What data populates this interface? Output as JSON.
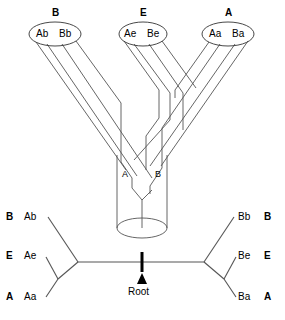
{
  "figure": {
    "title": "",
    "colors": {
      "stroke": "#555555",
      "heavy": "#000000",
      "background": "#ffffff"
    }
  },
  "top_panel": {
    "populations": [
      {
        "id": "B",
        "label": "B",
        "label_x": 55,
        "label_y": 8,
        "ellipse": {
          "cx": 55,
          "cy": 34,
          "rx": 26,
          "ry": 12
        },
        "alleles": [
          {
            "text": "Ab",
            "x": 43,
            "y": 34
          },
          {
            "text": "Bb",
            "x": 67,
            "y": 34
          }
        ]
      },
      {
        "id": "E",
        "label": "E",
        "label_x": 143,
        "label_y": 8,
        "ellipse": {
          "cx": 143,
          "cy": 34,
          "rx": 24,
          "ry": 12
        },
        "alleles": [
          {
            "text": "Ae",
            "x": 132,
            "y": 34
          },
          {
            "text": "Be",
            "x": 154,
            "y": 34
          }
        ]
      },
      {
        "id": "A",
        "label": "A",
        "label_x": 228,
        "label_y": 8,
        "ellipse": {
          "cx": 228,
          "cy": 34,
          "rx": 26,
          "ry": 12
        },
        "alleles": [
          {
            "text": "Aa",
            "x": 216,
            "y": 34
          },
          {
            "text": "Ba",
            "x": 240,
            "y": 34
          }
        ]
      }
    ],
    "tube_lineages": [
      {
        "text": "A",
        "x": 125,
        "y": 175
      },
      {
        "text": "B",
        "x": 158,
        "y": 175
      }
    ],
    "tube": {
      "left_x": 117,
      "right_x": 167,
      "top_y": 155,
      "bottom_y": 228,
      "base_ellipse_ry": 10
    }
  },
  "bottom_panel": {
    "left_tips": [
      {
        "pop": "B",
        "allele": "Ab",
        "pop_x": 8,
        "allele_x": 26,
        "y": 217
      },
      {
        "pop": "E",
        "allele": "Ae",
        "pop_x": 8,
        "allele_x": 26,
        "y": 256
      },
      {
        "pop": "A",
        "allele": "Aa",
        "pop_x": 8,
        "allele_x": 26,
        "y": 297
      }
    ],
    "right_tips": [
      {
        "pop": "B",
        "allele": "Bb",
        "allele_x": 240,
        "pop_x": 266,
        "y": 217
      },
      {
        "pop": "E",
        "allele": "Be",
        "allele_x": 240,
        "pop_x": 266,
        "y": 256
      },
      {
        "pop": "A",
        "allele": "Ba",
        "allele_x": 240,
        "pop_x": 266,
        "y": 297
      }
    ],
    "root": {
      "label": "Root",
      "label_x": 142,
      "label_y": 291,
      "tick_x": 142,
      "tick_top_y": 252,
      "tick_bottom_y": 272,
      "arrow_y": 276
    },
    "nodes": {
      "left_internal_x": 78,
      "left_internal_y": 262,
      "left_split_x": 58,
      "left_split_y": 279,
      "right_internal_x": 204,
      "right_internal_y": 262,
      "right_split_x": 224,
      "right_split_y": 279
    }
  }
}
